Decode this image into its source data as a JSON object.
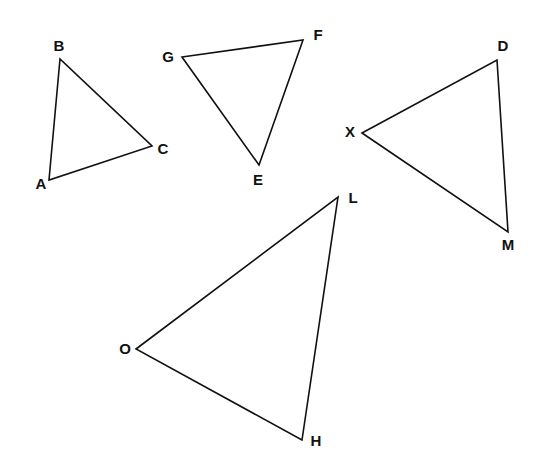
{
  "diagram": {
    "type": "geometry-triangles",
    "background": "#ffffff",
    "stroke_color": "#111111",
    "triangles": [
      {
        "name": "ABC",
        "points": "49,180 60,59 152,146",
        "vertices": [
          {
            "label": "A",
            "x": 49,
            "y": 180,
            "lx": 41,
            "ly": 189
          },
          {
            "label": "B",
            "x": 60,
            "y": 59,
            "lx": 59,
            "ly": 51
          },
          {
            "label": "C",
            "x": 152,
            "y": 146,
            "lx": 163,
            "ly": 154
          }
        ]
      },
      {
        "name": "GFE",
        "points": "182,57 303,40 259,165",
        "vertices": [
          {
            "label": "G",
            "x": 182,
            "y": 57,
            "lx": 168,
            "ly": 62
          },
          {
            "label": "F",
            "x": 303,
            "y": 40,
            "lx": 318,
            "ly": 40
          },
          {
            "label": "E",
            "x": 259,
            "y": 165,
            "lx": 258,
            "ly": 185
          }
        ]
      },
      {
        "name": "XDM",
        "points": "362,133 497,60 508,232",
        "vertices": [
          {
            "label": "X",
            "x": 362,
            "y": 133,
            "lx": 350,
            "ly": 137
          },
          {
            "label": "D",
            "x": 497,
            "y": 60,
            "lx": 503,
            "ly": 51
          },
          {
            "label": "M",
            "x": 508,
            "y": 232,
            "lx": 508,
            "ly": 250
          }
        ]
      },
      {
        "name": "OLH",
        "points": "136,349 338,197 302,440",
        "vertices": [
          {
            "label": "O",
            "x": 136,
            "y": 349,
            "lx": 125,
            "ly": 354
          },
          {
            "label": "L",
            "x": 338,
            "y": 197,
            "lx": 353,
            "ly": 203
          },
          {
            "label": "H",
            "x": 302,
            "y": 440,
            "lx": 316,
            "ly": 446
          }
        ]
      }
    ]
  }
}
